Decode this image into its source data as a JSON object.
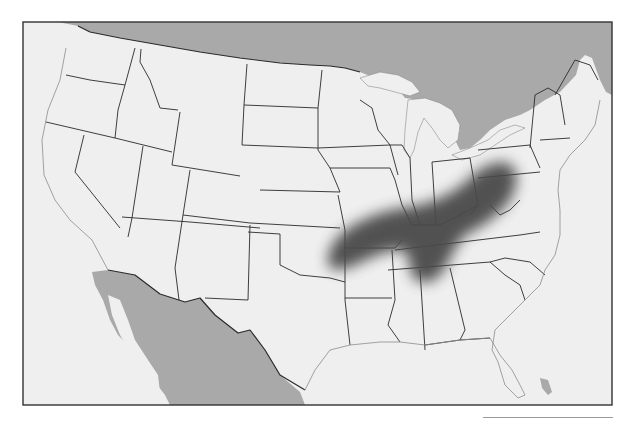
{
  "map": {
    "type": "outline-map",
    "region": "Contiguous United States",
    "colors": {
      "land": "#efefef",
      "foreign_land": "#a9a9a9",
      "water": "#efefef",
      "border": "#2a2a2a",
      "coast": "#8c8c8c",
      "highlight": "#4a4a4a",
      "frame": "#333333"
    },
    "highlight_region": {
      "description": "Shaded diagonal band from eastern Oklahoma / Arkansas through Tennessee, Kentucky, northern Alabama/Georgia to West Virginia and Virginia",
      "states_covered": [
        "Oklahoma (east)",
        "Arkansas (north)",
        "Missouri (south)",
        "Tennessee",
        "Kentucky",
        "Alabama (north)",
        "Georgia (northwest)",
        "West Virginia",
        "Virginia (west)",
        "North Carolina (west)"
      ]
    },
    "labels": []
  },
  "caption_rule": {
    "visible": true
  }
}
